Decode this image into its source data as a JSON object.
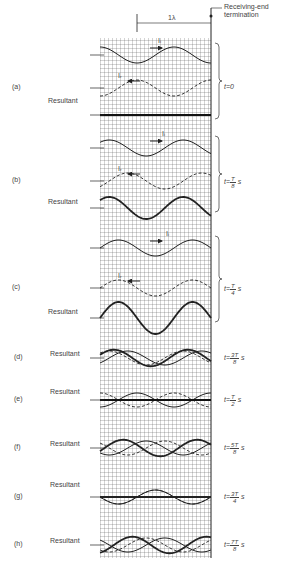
{
  "header": {
    "wavelength_label": "1λ",
    "termination_label_line1": "Receiving-end",
    "termination_label_line2": "termination"
  },
  "grid": {
    "x0": 100,
    "x1": 211,
    "y0": 38,
    "y1": 558,
    "cell": 4
  },
  "wave_labels": {
    "incident": "Iᵢ",
    "reflected": "Iᵣ"
  },
  "resultant_label": "Resultant",
  "panels": [
    {
      "id": "a",
      "label": "(a)",
      "time_prefix": "t=0",
      "num": "",
      "den": "",
      "suffix": ""
    },
    {
      "id": "b",
      "label": "(b)",
      "time_prefix": "t=",
      "num": "T",
      "den": "8",
      "suffix": "s"
    },
    {
      "id": "c",
      "label": "(c)",
      "time_prefix": "t=",
      "num": "T",
      "den": "4",
      "suffix": "s"
    },
    {
      "id": "d",
      "label": "(d)",
      "time_prefix": "t=",
      "num": "3T",
      "den": "8",
      "suffix": "s"
    },
    {
      "id": "e",
      "label": "(e)",
      "time_prefix": "t=",
      "num": "T",
      "den": "2",
      "suffix": "s"
    },
    {
      "id": "f",
      "label": "(f)",
      "time_prefix": "t=",
      "num": "5T",
      "den": "8",
      "suffix": "s"
    },
    {
      "id": "g",
      "label": "(g)",
      "time_prefix": "t=",
      "num": "3T",
      "den": "4",
      "suffix": "s"
    },
    {
      "id": "h",
      "label": "(h)",
      "time_prefix": "t=",
      "num": "7T",
      "den": "8",
      "suffix": "s"
    }
  ]
}
